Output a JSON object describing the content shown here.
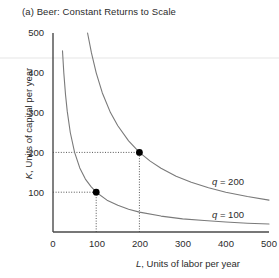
{
  "figure": {
    "title": "(a) Beer: Constant Returns to Scale",
    "panel_letter": "(a)"
  },
  "chart_data": {
    "type": "line",
    "title": "(a) Beer: Constant Returns to Scale",
    "subtitle": "",
    "xlabel": "L, Units of labor per year",
    "ylabel": "K, Units of capital per year",
    "xlabel_symbol": "L",
    "xlabel_rest": ", Units of labor per year",
    "ylabel_symbol": "K",
    "ylabel_rest": ", Units of capital per year",
    "xlim": [
      0,
      500
    ],
    "ylim": [
      0,
      500
    ],
    "xticks": [
      0,
      100,
      200,
      300,
      400,
      500
    ],
    "xtick_labels": [
      "0",
      "100",
      "200",
      "300",
      "400",
      "500"
    ],
    "yticks": [
      100,
      200,
      300,
      400,
      500
    ],
    "ytick_labels": [
      "100",
      "200",
      "300",
      "400",
      "500"
    ],
    "grid": false,
    "legend_position": "inline-right",
    "curve_color": "#7a7a7a",
    "axis_color": "#4a4a4a",
    "marker_color": "#000000",
    "guide_color": "#555555",
    "series": [
      {
        "name": "q = 100",
        "label_symbol": "q",
        "label_rest": " = 100",
        "isoquant_constant": 10000,
        "label_x": 370,
        "label_y": 62,
        "points": [
          {
            "x": 22,
            "y": 455
          },
          {
            "x": 25,
            "y": 400
          },
          {
            "x": 29,
            "y": 345
          },
          {
            "x": 33,
            "y": 303
          },
          {
            "x": 40,
            "y": 250
          },
          {
            "x": 50,
            "y": 200
          },
          {
            "x": 62,
            "y": 161
          },
          {
            "x": 75,
            "y": 133
          },
          {
            "x": 88,
            "y": 114
          },
          {
            "x": 100,
            "y": 100
          },
          {
            "x": 125,
            "y": 80
          },
          {
            "x": 150,
            "y": 67
          },
          {
            "x": 175,
            "y": 57
          },
          {
            "x": 200,
            "y": 50
          },
          {
            "x": 250,
            "y": 40
          },
          {
            "x": 300,
            "y": 33
          },
          {
            "x": 350,
            "y": 29
          },
          {
            "x": 400,
            "y": 25
          },
          {
            "x": 450,
            "y": 22
          },
          {
            "x": 500,
            "y": 20
          }
        ]
      },
      {
        "name": "q = 200",
        "label_symbol": "q",
        "label_rest": " = 200",
        "isoquant_constant": 40000,
        "label_x": 370,
        "label_y": 142,
        "points": [
          {
            "x": 80,
            "y": 500
          },
          {
            "x": 89,
            "y": 450
          },
          {
            "x": 100,
            "y": 400
          },
          {
            "x": 114,
            "y": 350
          },
          {
            "x": 133,
            "y": 300
          },
          {
            "x": 150,
            "y": 267
          },
          {
            "x": 175,
            "y": 229
          },
          {
            "x": 200,
            "y": 200
          },
          {
            "x": 225,
            "y": 178
          },
          {
            "x": 250,
            "y": 160
          },
          {
            "x": 285,
            "y": 140
          },
          {
            "x": 320,
            "y": 125
          },
          {
            "x": 360,
            "y": 111
          },
          {
            "x": 400,
            "y": 100
          },
          {
            "x": 450,
            "y": 89
          },
          {
            "x": 500,
            "y": 80
          }
        ]
      }
    ],
    "markers": [
      {
        "name": "point-q100",
        "x": 100,
        "y": 100,
        "label": "",
        "on_series": "q = 100"
      },
      {
        "name": "point-q200",
        "x": 200,
        "y": 200,
        "label": "",
        "on_series": "q = 200"
      }
    ],
    "guide_lines": [
      {
        "name": "guide-h-100",
        "from": {
          "x": 0,
          "y": 100
        },
        "to": {
          "x": 100,
          "y": 100
        },
        "style": "dotted"
      },
      {
        "name": "guide-v-100",
        "from": {
          "x": 100,
          "y": 0
        },
        "to": {
          "x": 100,
          "y": 100
        },
        "style": "dotted"
      },
      {
        "name": "guide-h-200",
        "from": {
          "x": 0,
          "y": 200
        },
        "to": {
          "x": 200,
          "y": 200
        },
        "style": "dotted"
      },
      {
        "name": "guide-v-200",
        "from": {
          "x": 200,
          "y": 0
        },
        "to": {
          "x": 200,
          "y": 200
        },
        "style": "dotted"
      }
    ],
    "annotations": [
      {
        "text": "q = 200",
        "x": 370,
        "y": 142
      },
      {
        "text": "q = 100",
        "x": 370,
        "y": 62
      }
    ]
  }
}
